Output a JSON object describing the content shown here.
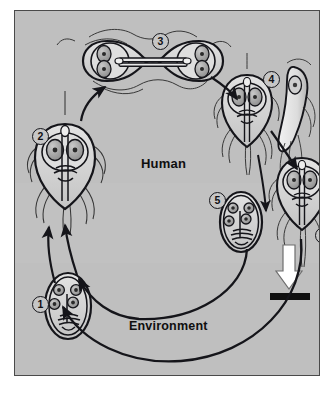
{
  "figure": {
    "frame": {
      "background_color": "#bfbfbf",
      "border_color": "#4a4a4a",
      "outer_background_color": "#ffffff"
    },
    "zones": [
      {
        "id": "human",
        "label": "Human",
        "region": "upper"
      },
      {
        "id": "environment",
        "label": "Environment",
        "region": "lower"
      }
    ],
    "stages": [
      {
        "number": "1",
        "label": "1",
        "organism": "cyst",
        "zone": "environment",
        "description": "Quadrinucleate infective cyst ingested from environment"
      },
      {
        "number": "2",
        "label": "2",
        "organism": "trophozoite",
        "zone": "human",
        "description": "Excystation releases trophozoite in small intestine"
      },
      {
        "number": "3",
        "label": "3",
        "organism": "dividing-trophozoite",
        "zone": "human",
        "description": "Trophozoite multiplies by binary fission"
      },
      {
        "number": "4",
        "label": "4",
        "organism": "attached-trophozoite",
        "zone": "human",
        "description": "Trophozoite attaches to intestinal epithelium by ventral sucking disc"
      },
      {
        "number": "5",
        "label": "5",
        "organism": "cyst",
        "zone": "human",
        "description": "Encystation forms cyst passed in stool"
      },
      {
        "number": "6",
        "label": "6",
        "organism": "trophozoite",
        "zone": "human",
        "description": "Trophozoite may also be passed in stool"
      }
    ],
    "excretion": {
      "arrow": "white-down-arrow",
      "bar": "black-bar",
      "description": "Excretion of cysts and trophozoites in feces"
    },
    "colors": {
      "background": "#bfbfbf",
      "ink": "#15151a",
      "organism_fill": "#d6d6d6",
      "nucleus_fill": "#9a9a9a",
      "excretion_arrow": "#ffffff",
      "excretion_bar": "#101010"
    }
  }
}
